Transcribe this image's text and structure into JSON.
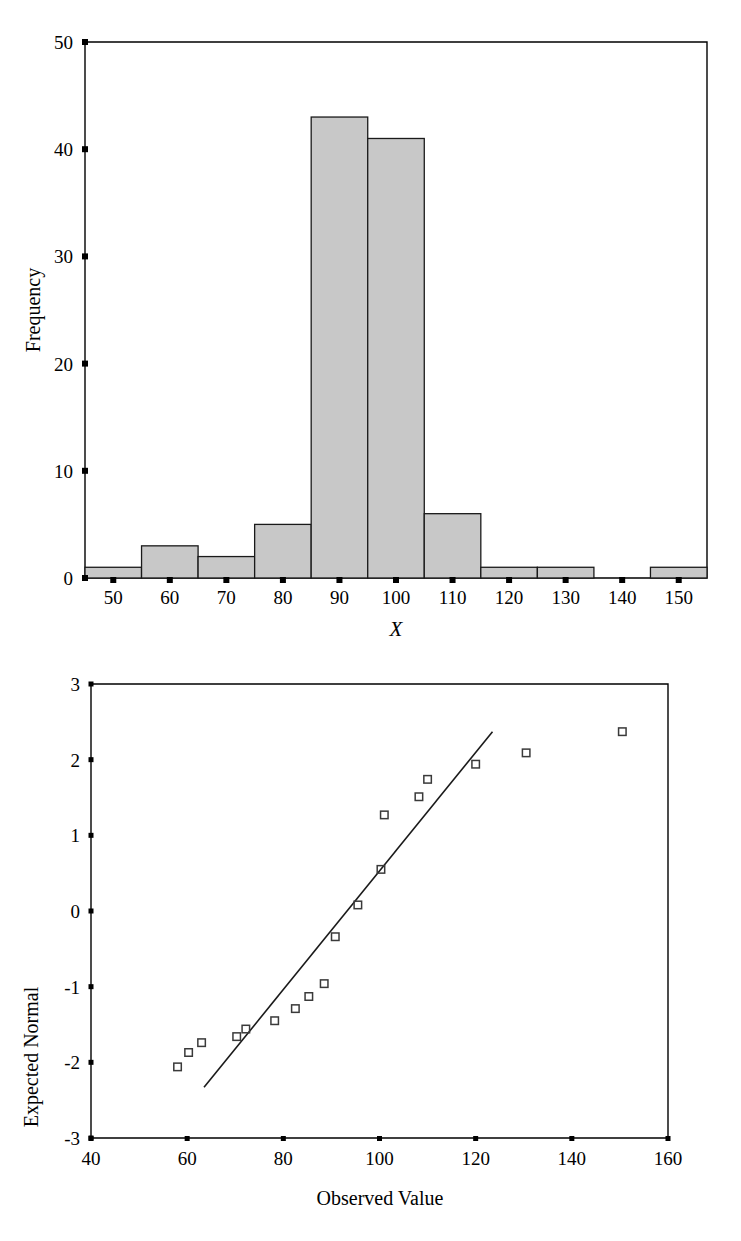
{
  "chart_data": [
    {
      "type": "bar",
      "name": "histogram-of-x",
      "title": "",
      "xlabel": "X",
      "ylabel": "Frequency",
      "xlim": [
        45,
        155
      ],
      "ylim": [
        0,
        50
      ],
      "xticks": [
        50,
        60,
        70,
        80,
        90,
        100,
        110,
        120,
        130,
        140,
        150
      ],
      "yticks": [
        0,
        10,
        20,
        30,
        40,
        50
      ],
      "xtick_labels": [
        "50",
        "60",
        "70",
        "80",
        "90",
        "100",
        "110",
        "120",
        "130",
        "140",
        "150"
      ],
      "ytick_labels": [
        "0",
        "10",
        "20",
        "30",
        "40",
        "50"
      ],
      "bin_width": 10,
      "bin_centers": [
        50,
        60,
        70,
        80,
        90,
        100,
        110,
        120,
        130,
        140,
        150
      ],
      "categories": [
        "50",
        "60",
        "70",
        "80",
        "90",
        "100",
        "110",
        "120",
        "130",
        "140",
        "150"
      ],
      "values": [
        1,
        3,
        2,
        5,
        43,
        41,
        6,
        1,
        1,
        0,
        1
      ],
      "grid": false,
      "legend": "none",
      "bar_fill": "#c8c8c8",
      "bar_stroke": "#1a1a1a"
    },
    {
      "type": "scatter",
      "name": "normal-q-q-plot",
      "title": "",
      "xlabel": "Observed Value",
      "ylabel": "Expected Normal",
      "xlim": [
        40,
        160
      ],
      "ylim": [
        -3,
        3
      ],
      "xticks": [
        40,
        60,
        80,
        100,
        120,
        140,
        160
      ],
      "yticks": [
        -3,
        -2,
        -1,
        0,
        1,
        2,
        3
      ],
      "xtick_labels": [
        "40",
        "60",
        "80",
        "100",
        "120",
        "140",
        "160"
      ],
      "ytick_labels": [
        "-3",
        "-2",
        "-1",
        "0",
        "1",
        "2",
        "3"
      ],
      "grid": false,
      "legend": "none",
      "marker": "open-square",
      "marker_stroke": "#3a3a3a",
      "points": [
        {
          "x": 58.0,
          "y": -2.06
        },
        {
          "x": 60.3,
          "y": -1.87
        },
        {
          "x": 63.0,
          "y": -1.74
        },
        {
          "x": 70.3,
          "y": -1.66
        },
        {
          "x": 72.2,
          "y": -1.56
        },
        {
          "x": 78.2,
          "y": -1.45
        },
        {
          "x": 82.5,
          "y": -1.29
        },
        {
          "x": 85.3,
          "y": -1.13
        },
        {
          "x": 88.5,
          "y": -0.96
        },
        {
          "x": 90.8,
          "y": -0.34
        },
        {
          "x": 95.5,
          "y": 0.08
        },
        {
          "x": 100.3,
          "y": 0.55
        },
        {
          "x": 101.0,
          "y": 1.27
        },
        {
          "x": 108.2,
          "y": 1.51
        },
        {
          "x": 110.0,
          "y": 1.74
        },
        {
          "x": 120.0,
          "y": 1.94
        },
        {
          "x": 130.5,
          "y": 2.09
        },
        {
          "x": 150.5,
          "y": 2.37
        }
      ],
      "reference_line": {
        "x1": 63.5,
        "y1": -2.33,
        "x2": 123.5,
        "y2": 2.37
      }
    }
  ]
}
